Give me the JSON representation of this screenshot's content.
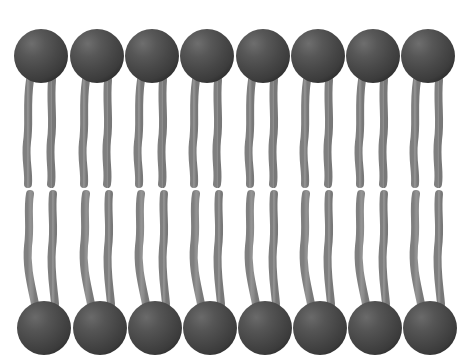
{
  "figure": {
    "kind": "diagram",
    "background_color": "#ffffff",
    "width": 475,
    "height": 363
  },
  "palette": {
    "head_fill": "#4a4a4a",
    "head_dark": "#3a3a3a",
    "head_highlight": "#6e6e6e",
    "head_shadow": "#303030",
    "tail_stroke": "#8b8b8b",
    "tail_stroke_light": "#9a9a9a",
    "background": "#ffffff"
  },
  "structure": {
    "columns": 8,
    "leaflets": [
      {
        "name": "outer-leaflet",
        "label": "Upper leaflet",
        "head_row_cy": 56,
        "head_radius": 27,
        "tails_per_lipid": 2,
        "tail_direction": "down",
        "tail_start_y": 80,
        "tail_end_y": 184
      },
      {
        "name": "inner-leaflet",
        "label": "Lower leaflet",
        "head_row_cy": 328,
        "head_radius": 27,
        "tails_per_lipid": 2,
        "tail_direction": "up",
        "tail_start_y": 304,
        "tail_end_y": 194
      }
    ],
    "hydrophobic_gap": {
      "top_y": 184,
      "bottom_y": 194
    },
    "top_head_centers_x": [
      41,
      97,
      152,
      207,
      263,
      318,
      373,
      428
    ],
    "bottom_head_centers_x": [
      44,
      100,
      155,
      210,
      265,
      320,
      375,
      430
    ],
    "tail_offset_x": [
      -11,
      11
    ],
    "tail_width": 8
  },
  "chart_data": {
    "type": "scatter",
    "xlabel": "",
    "ylabel": "",
    "series": [
      {
        "name": "outer-leaflet-heads",
        "x": [
          41,
          97,
          152,
          207,
          263,
          318,
          373,
          428
        ],
        "y": [
          56,
          56,
          56,
          56,
          56,
          56,
          56,
          56
        ]
      },
      {
        "name": "inner-leaflet-heads",
        "x": [
          44,
          100,
          155,
          210,
          265,
          320,
          375,
          430
        ],
        "y": [
          328,
          328,
          328,
          328,
          328,
          328,
          328,
          328
        ]
      }
    ]
  }
}
